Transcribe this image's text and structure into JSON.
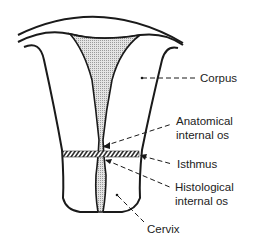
{
  "diagram": {
    "colors": {
      "outline": "#1a1a1a",
      "cavity_fill": "#cfcfcf",
      "background": "#ffffff"
    },
    "labels": {
      "corpus": "Corpus",
      "anatomical_os_line1": "Anatomical",
      "anatomical_os_line2": "internal os",
      "isthmus": "Isthmus",
      "histological_os_line1": "Histological",
      "histological_os_line2": "internal os",
      "cervix": "Cervix"
    }
  }
}
